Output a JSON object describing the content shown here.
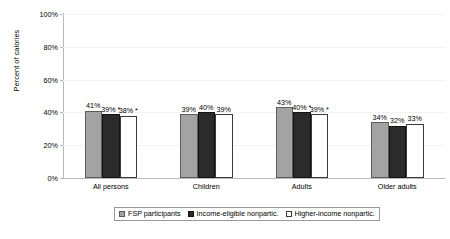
{
  "chart_data": {
    "type": "bar",
    "title": "",
    "xlabel": "",
    "ylabel": "Percent of calories",
    "ylim": [
      0,
      100
    ],
    "yticks": [
      "0%",
      "20%",
      "40%",
      "60%",
      "80%",
      "100%"
    ],
    "ytick_values": [
      0,
      20,
      40,
      60,
      80,
      100
    ],
    "grid": true,
    "legend_position": "bottom",
    "categories": [
      "All persons",
      "Children",
      "Adults",
      "Older adults"
    ],
    "series": [
      {
        "name": "FSP participants",
        "color": "#a3a3a3",
        "values": [
          41,
          39,
          43,
          34
        ],
        "labels": [
          "41%",
          "39%",
          "43%",
          "34%"
        ]
      },
      {
        "name": "Income-eligible nonpartic.",
        "color": "#2b2b2b",
        "values": [
          39,
          40,
          40,
          32
        ],
        "labels": [
          "39% *",
          "40%",
          "40% *",
          "32%"
        ]
      },
      {
        "name": "Higher-income nonpartic.",
        "color": "#ffffff",
        "values": [
          38,
          39,
          39,
          33
        ],
        "labels": [
          "38% *",
          "39%",
          "39% *",
          "33%"
        ]
      }
    ]
  }
}
